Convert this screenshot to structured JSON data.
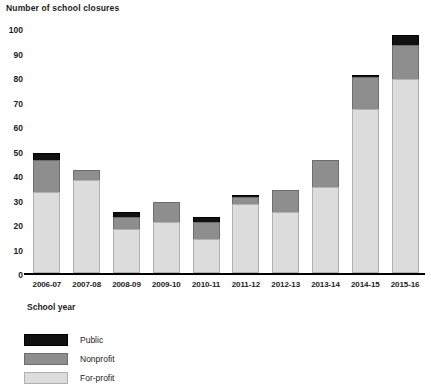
{
  "chart_data": {
    "type": "bar",
    "title": "",
    "ylabel": "Number of school closures",
    "xlabel": "School year",
    "ylim": [
      0,
      100
    ],
    "yticks": [
      0,
      10,
      20,
      30,
      40,
      50,
      60,
      70,
      80,
      90,
      100
    ],
    "grid": false,
    "stacked": true,
    "legend_position": "below",
    "categories": [
      "2006-07",
      "2007-08",
      "2008-09",
      "2009-10",
      "2010-11",
      "2011-12",
      "2012-13",
      "2013-14",
      "2014-15",
      "2015-16"
    ],
    "series": [
      {
        "name": "For-profit",
        "color": "#dcdcdc",
        "values": [
          33,
          38,
          18,
          21,
          14,
          28,
          25,
          35,
          67,
          79
        ]
      },
      {
        "name": "Nonprofit",
        "color": "#8e8e8e",
        "values": [
          13,
          4,
          5,
          8,
          7,
          3,
          9,
          11,
          13,
          14
        ]
      },
      {
        "name": "Public",
        "color": "#111111",
        "values": [
          3,
          0,
          2,
          0,
          2,
          1,
          0,
          0,
          1,
          4
        ]
      }
    ],
    "totals": [
      49,
      42,
      25,
      29,
      23,
      32,
      34,
      46,
      81,
      97
    ]
  },
  "legend": {
    "items": [
      {
        "label": "Public",
        "color": "#111111"
      },
      {
        "label": "Nonprofit",
        "color": "#8e8e8e"
      },
      {
        "label": "For-profit",
        "color": "#dcdcdc"
      }
    ]
  }
}
